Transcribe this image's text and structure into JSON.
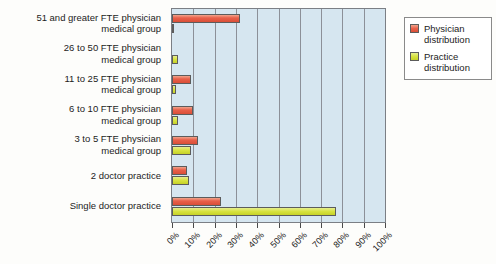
{
  "chart_data": {
    "type": "bar",
    "orientation": "horizontal",
    "title": "",
    "xlabel": "",
    "ylabel": "",
    "xlim": [
      0,
      100
    ],
    "xtick_step": 10,
    "grid": true,
    "legend_position": "right",
    "categories": [
      "51 and greater FTE physician\nmedical group",
      "26 to 50 FTE physician\nmedical group",
      "11 to 25 FTE physician\nmedical group",
      "6 to 10 FTE physician\nmedical group",
      "3 to 5 FTE physician\nmedical group",
      "2 doctor practice",
      "Single doctor practice"
    ],
    "tick_labels": [
      "0%",
      "10%",
      "20%",
      "30%",
      "40%",
      "50%",
      "60%",
      "70%",
      "80%",
      "90%",
      "100%"
    ],
    "series": [
      {
        "name": "Physician distribution",
        "color": "#e9604a",
        "values": [
          32,
          0,
          9,
          10,
          12,
          7,
          23
        ]
      },
      {
        "name": "Practice distribution",
        "color": "#d8e33f",
        "values": [
          1,
          3,
          2,
          3,
          9,
          8,
          77
        ]
      }
    ]
  },
  "legend": {
    "items": [
      {
        "label": "Physician\ndistribution",
        "swatch": "physician"
      },
      {
        "label": "Practice\ndistribution",
        "swatch": "practice"
      }
    ]
  },
  "colors": {
    "plot_background": "#d6e6f0",
    "gridline": "#8c9098",
    "axis": "#7b7f85",
    "physician": "#e9604a",
    "practice": "#d8e33f",
    "page_background": "#fdfdfb"
  }
}
